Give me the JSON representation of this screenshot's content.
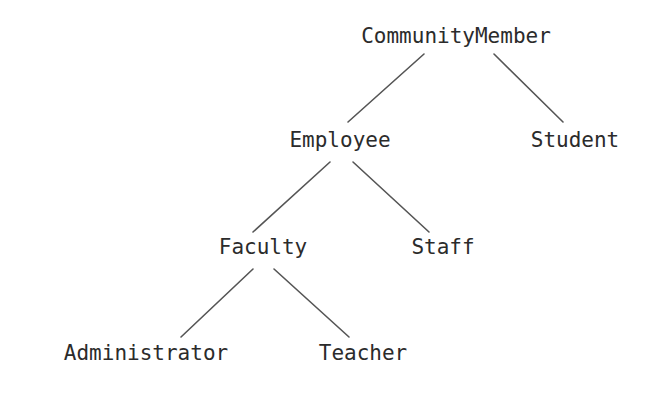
{
  "diagram": {
    "type": "tree",
    "background_color": "#ffffff",
    "text_color": "#2b2b2b",
    "edge_color": "#555555",
    "nodes": [
      {
        "id": "community-member",
        "label": "CommunityMember",
        "level": 0,
        "x": 456,
        "y": 40
      },
      {
        "id": "employee",
        "label": "Employee",
        "level": 1,
        "x": 340,
        "y": 144
      },
      {
        "id": "student",
        "label": "Student",
        "level": 1,
        "x": 575,
        "y": 144
      },
      {
        "id": "faculty",
        "label": "Faculty",
        "level": 2,
        "x": 263,
        "y": 251
      },
      {
        "id": "staff",
        "label": "Staff",
        "level": 2,
        "x": 443,
        "y": 251
      },
      {
        "id": "administrator",
        "label": "Administrator",
        "level": 3,
        "x": 146,
        "y": 357
      },
      {
        "id": "teacher",
        "label": "Teacher",
        "level": 3,
        "x": 363,
        "y": 357
      }
    ],
    "edges": [
      {
        "id": "edge-community-member-employee",
        "from": "community-member",
        "to": "employee",
        "x1": 424,
        "y1": 54,
        "x2": 348,
        "y2": 122
      },
      {
        "id": "edge-community-member-student",
        "from": "community-member",
        "to": "student",
        "x1": 494,
        "y1": 54,
        "x2": 563,
        "y2": 122
      },
      {
        "id": "edge-employee-faculty",
        "from": "employee",
        "to": "faculty",
        "x1": 330,
        "y1": 162,
        "x2": 253,
        "y2": 232
      },
      {
        "id": "edge-employee-staff",
        "from": "employee",
        "to": "staff",
        "x1": 353,
        "y1": 162,
        "x2": 429,
        "y2": 232
      },
      {
        "id": "edge-faculty-administrator",
        "from": "faculty",
        "to": "administrator",
        "x1": 253,
        "y1": 269,
        "x2": 181,
        "y2": 337
      },
      {
        "id": "edge-faculty-teacher",
        "from": "faculty",
        "to": "teacher",
        "x1": 274,
        "y1": 269,
        "x2": 349,
        "y2": 337
      }
    ]
  }
}
